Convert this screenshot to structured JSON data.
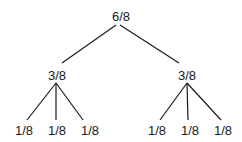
{
  "diagram": {
    "type": "tree",
    "root": {
      "label": "6/8",
      "children": [
        {
          "label": "3/8",
          "children": [
            {
              "label": "1/8"
            },
            {
              "label": "1/8"
            },
            {
              "label": "1/8"
            }
          ]
        },
        {
          "label": "3/8",
          "children": [
            {
              "label": "1/8"
            },
            {
              "label": "1/8"
            },
            {
              "label": "1/8"
            }
          ]
        }
      ]
    }
  }
}
